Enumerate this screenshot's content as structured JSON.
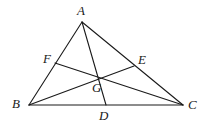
{
  "figure": {
    "kind": "geometry-diagram",
    "background_color": "#ffffff",
    "stroke_color": "#1a1a1a",
    "label_color": "#1a1a1a",
    "stroke_width": 1.1,
    "width": 210,
    "height": 136
  },
  "points": {
    "A": {
      "label": "A",
      "x": 82,
      "y": 22,
      "label_x": 77,
      "label_y": 4
    },
    "B": {
      "label": "B",
      "x": 29,
      "y": 105,
      "label_x": 12,
      "label_y": 97
    },
    "C": {
      "label": "C",
      "x": 183,
      "y": 105,
      "label_x": 188,
      "label_y": 98
    },
    "D": {
      "label": "D",
      "x": 106,
      "y": 105,
      "label_x": 99,
      "label_y": 109
    },
    "E": {
      "label": "E",
      "x": 134,
      "y": 66,
      "label_x": 138,
      "label_y": 53
    },
    "F": {
      "label": "F",
      "x": 55,
      "y": 63,
      "label_x": 43,
      "label_y": 52
    },
    "G": {
      "label": "G",
      "x": 99,
      "y": 77,
      "label_x": 92,
      "label_y": 81
    }
  },
  "segments": [
    {
      "name": "side-AB",
      "from": "A",
      "to": "B"
    },
    {
      "name": "side-BC",
      "from": "B",
      "to": "C"
    },
    {
      "name": "side-CA",
      "from": "C",
      "to": "A"
    },
    {
      "name": "cevian-AD",
      "from": "A",
      "to": "D"
    },
    {
      "name": "cevian-BE",
      "from": "B",
      "to": "E"
    },
    {
      "name": "cevian-CF",
      "from": "C",
      "to": "F"
    }
  ]
}
